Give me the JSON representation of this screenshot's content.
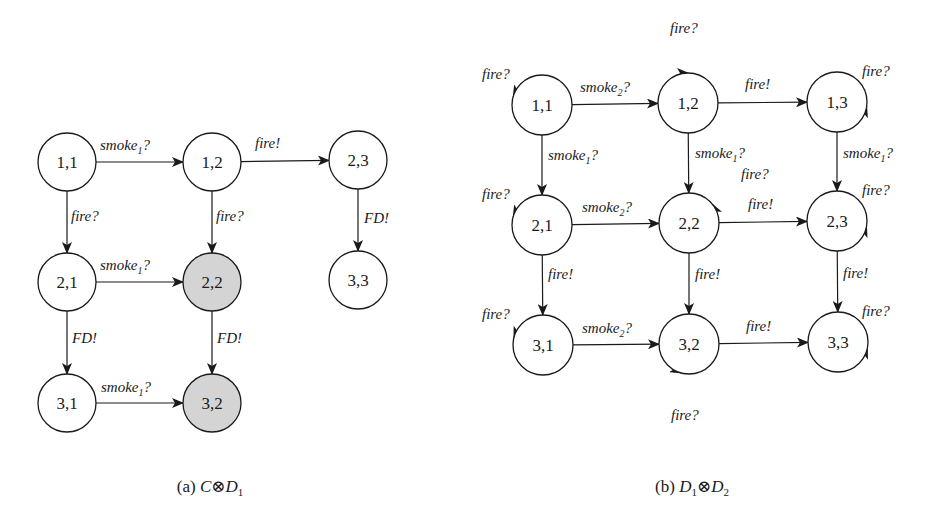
{
  "colors": {
    "stroke": "#1a1a1a",
    "node_fill": "#ffffff",
    "highlight_fill": "#d4d4d4",
    "background": "#ffffff"
  },
  "diagrams": [
    {
      "id": "a",
      "caption": {
        "prefix": "(a) ",
        "parts": [
          {
            "text": "C",
            "italic": true
          },
          {
            "text": "⊗",
            "italic": false
          },
          {
            "text": "D",
            "italic": true
          },
          {
            "text": "1",
            "sub": true
          }
        ],
        "x": 210,
        "y": 492
      },
      "node_radius": 29,
      "nodes": [
        {
          "id": "1,1",
          "label": "1,1",
          "x": 67,
          "y": 162,
          "highlight": false
        },
        {
          "id": "1,2",
          "label": "1,2",
          "x": 212,
          "y": 162,
          "highlight": false
        },
        {
          "id": "2,3",
          "label": "2,3",
          "x": 358,
          "y": 160,
          "highlight": false
        },
        {
          "id": "2,1",
          "label": "2,1",
          "x": 67,
          "y": 282,
          "highlight": false
        },
        {
          "id": "2,2",
          "label": "2,2",
          "x": 212,
          "y": 282,
          "highlight": true
        },
        {
          "id": "3,3",
          "label": "3,3",
          "x": 358,
          "y": 280,
          "highlight": false
        },
        {
          "id": "3,1",
          "label": "3,1",
          "x": 67,
          "y": 403,
          "highlight": false
        },
        {
          "id": "3,2",
          "label": "3,2",
          "x": 212,
          "y": 403,
          "highlight": true
        }
      ],
      "edges": [
        {
          "from": "1,1",
          "to": "1,2",
          "label": "smoke",
          "sub": "1",
          "suffix": "?",
          "lx": 100,
          "ly": 150
        },
        {
          "from": "1,2",
          "to": "2,3",
          "label": "fire",
          "sub": "",
          "suffix": "!",
          "lx": 255,
          "ly": 148
        },
        {
          "from": "1,1",
          "to": "2,1",
          "label": "fire",
          "sub": "",
          "suffix": "?",
          "lx": 71,
          "ly": 221
        },
        {
          "from": "1,2",
          "to": "2,2",
          "label": "fire",
          "sub": "",
          "suffix": "?",
          "lx": 216,
          "ly": 221
        },
        {
          "from": "2,3",
          "to": "3,3",
          "label": "FD",
          "sub": "",
          "suffix": "!",
          "lx": 364,
          "ly": 223
        },
        {
          "from": "2,1",
          "to": "2,2",
          "label": "smoke",
          "sub": "1",
          "suffix": "?",
          "lx": 100,
          "ly": 270
        },
        {
          "from": "2,1",
          "to": "3,1",
          "label": "FD",
          "sub": "",
          "suffix": "!",
          "lx": 72,
          "ly": 343
        },
        {
          "from": "2,2",
          "to": "3,2",
          "label": "FD",
          "sub": "",
          "suffix": "!",
          "lx": 217,
          "ly": 343
        },
        {
          "from": "3,1",
          "to": "3,2",
          "label": "smoke",
          "sub": "1",
          "suffix": "?",
          "lx": 101,
          "ly": 392
        }
      ],
      "loops": []
    },
    {
      "id": "b",
      "caption": {
        "prefix": "(b) ",
        "parts": [
          {
            "text": "D",
            "italic": true
          },
          {
            "text": "1",
            "sub": true
          },
          {
            "text": "⊗",
            "italic": false
          },
          {
            "text": "D",
            "italic": true
          },
          {
            "text": "2",
            "sub": true
          }
        ],
        "x": 692,
        "y": 492
      },
      "node_radius": 30,
      "nodes": [
        {
          "id": "1,1",
          "label": "1,1",
          "x": 542,
          "y": 105,
          "highlight": false
        },
        {
          "id": "1,2",
          "label": "1,2",
          "x": 688,
          "y": 103,
          "highlight": false
        },
        {
          "id": "1,3",
          "label": "1,3",
          "x": 837,
          "y": 102,
          "highlight": false
        },
        {
          "id": "2,1",
          "label": "2,1",
          "x": 542,
          "y": 225,
          "highlight": false
        },
        {
          "id": "2,2",
          "label": "2,2",
          "x": 689,
          "y": 223,
          "highlight": false
        },
        {
          "id": "2,3",
          "label": "2,3",
          "x": 837,
          "y": 221,
          "highlight": false
        },
        {
          "id": "3,1",
          "label": "3,1",
          "x": 543,
          "y": 345,
          "highlight": false
        },
        {
          "id": "3,2",
          "label": "3,2",
          "x": 689,
          "y": 344,
          "highlight": false
        },
        {
          "id": "3,3",
          "label": "3,3",
          "x": 838,
          "y": 342,
          "highlight": false
        }
      ],
      "edges": [
        {
          "from": "1,1",
          "to": "1,2",
          "label": "smoke",
          "sub": "2",
          "suffix": "?",
          "lx": 580,
          "ly": 92
        },
        {
          "from": "1,2",
          "to": "1,3",
          "label": "fire",
          "sub": "",
          "suffix": "!",
          "lx": 745,
          "ly": 89
        },
        {
          "from": "1,1",
          "to": "2,1",
          "label": "smoke",
          "sub": "1",
          "suffix": "?",
          "lx": 548,
          "ly": 160
        },
        {
          "from": "1,2",
          "to": "2,2",
          "label": "smoke",
          "sub": "1",
          "suffix": "?",
          "lx": 695,
          "ly": 158
        },
        {
          "from": "1,3",
          "to": "2,3",
          "label": "smoke",
          "sub": "1",
          "suffix": "?",
          "lx": 843,
          "ly": 158
        },
        {
          "from": "2,1",
          "to": "2,2",
          "label": "smoke",
          "sub": "2",
          "suffix": "?",
          "lx": 582,
          "ly": 212
        },
        {
          "from": "2,2",
          "to": "2,3",
          "label": "fire",
          "sub": "",
          "suffix": "!",
          "lx": 748,
          "ly": 209
        },
        {
          "from": "2,1",
          "to": "3,1",
          "label": "fire",
          "sub": "",
          "suffix": "!",
          "lx": 548,
          "ly": 279
        },
        {
          "from": "2,2",
          "to": "3,2",
          "label": "fire",
          "sub": "",
          "suffix": "!",
          "lx": 695,
          "ly": 279
        },
        {
          "from": "2,3",
          "to": "3,3",
          "label": "fire",
          "sub": "",
          "suffix": "!",
          "lx": 843,
          "ly": 278
        },
        {
          "from": "3,1",
          "to": "3,2",
          "label": "smoke",
          "sub": "2",
          "suffix": "?",
          "lx": 582,
          "ly": 333
        },
        {
          "from": "3,2",
          "to": "3,3",
          "label": "fire",
          "sub": "",
          "suffix": "!",
          "lx": 746,
          "ly": 331
        }
      ],
      "loops": [
        {
          "node": "1,1",
          "side": "left",
          "cx": 498,
          "cy": 104,
          "r": 17,
          "label": "fire",
          "suffix": "?",
          "lx": 482,
          "ly": 79
        },
        {
          "node": "1,2",
          "side": "top",
          "cx": 688,
          "cy": 57,
          "r": 16,
          "label": "fire",
          "suffix": "?",
          "lx": 670,
          "ly": 33
        },
        {
          "node": "1,3",
          "side": "right",
          "cx": 881,
          "cy": 99,
          "r": 16,
          "label": "fire",
          "suffix": "?",
          "lx": 862,
          "ly": 76
        },
        {
          "node": "2,1",
          "side": "left",
          "cx": 498,
          "cy": 224,
          "r": 17,
          "label": "fire",
          "suffix": "?",
          "lx": 482,
          "ly": 199
        },
        {
          "node": "2,2",
          "side": "top-right",
          "cx": 717,
          "cy": 189,
          "r": 16,
          "label": "fire",
          "suffix": "?",
          "lx": 741,
          "ly": 179
        },
        {
          "node": "2,3",
          "side": "right",
          "cx": 881,
          "cy": 219,
          "r": 16,
          "label": "fire",
          "suffix": "?",
          "lx": 862,
          "ly": 195
        },
        {
          "node": "3,1",
          "side": "left",
          "cx": 498,
          "cy": 344,
          "r": 17,
          "label": "fire",
          "suffix": "?",
          "lx": 482,
          "ly": 319
        },
        {
          "node": "3,2",
          "side": "bottom",
          "cx": 689,
          "cy": 387,
          "r": 16,
          "label": "fire",
          "suffix": "?",
          "lx": 671,
          "ly": 420
        },
        {
          "node": "3,3",
          "side": "right",
          "cx": 882,
          "cy": 341,
          "r": 16,
          "label": "fire",
          "suffix": "?",
          "lx": 862,
          "ly": 316
        }
      ]
    }
  ]
}
